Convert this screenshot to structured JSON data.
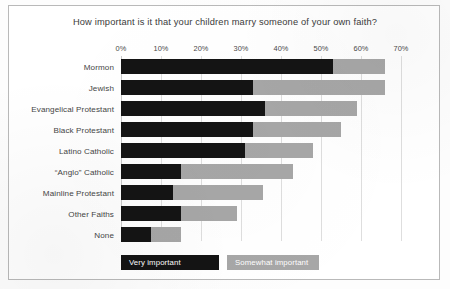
{
  "chart_data": {
    "type": "bar",
    "title": "How important is it that your children marry someone of your own faith?",
    "xlabel": "",
    "ylabel": "",
    "orientation": "horizontal",
    "stacked": true,
    "grid": true,
    "legend_position": "bottom-left",
    "xlim": [
      0,
      70
    ],
    "xticks": [
      0,
      10,
      20,
      30,
      40,
      50,
      60,
      70
    ],
    "xtick_labels": [
      "0%",
      "10%",
      "20%",
      "30%",
      "40%",
      "50%",
      "60%",
      "70%"
    ],
    "categories": [
      "Mormon",
      "Jewish",
      "Evangelical Protestant",
      "Black Protestant",
      "Latino Catholic",
      "“Anglo” Catholic",
      "Mainline Protestant",
      "Other Faiths",
      "None"
    ],
    "series": [
      {
        "name": "Very important",
        "color": "#141414",
        "values": [
          53,
          33,
          36,
          33,
          31,
          15,
          13,
          15,
          7.5
        ]
      },
      {
        "name": "Somewhat important",
        "color": "#a7a7a7",
        "values": [
          13,
          33,
          23,
          22,
          17,
          28,
          22.5,
          14,
          7.5
        ]
      }
    ],
    "totals": [
      66,
      66,
      59,
      55,
      48,
      43,
      35.5,
      29,
      15
    ]
  },
  "legend": {
    "items": [
      {
        "label": "Very important",
        "color": "#141414"
      },
      {
        "label": "Somewhat important",
        "color": "#a7a7a7"
      }
    ]
  }
}
